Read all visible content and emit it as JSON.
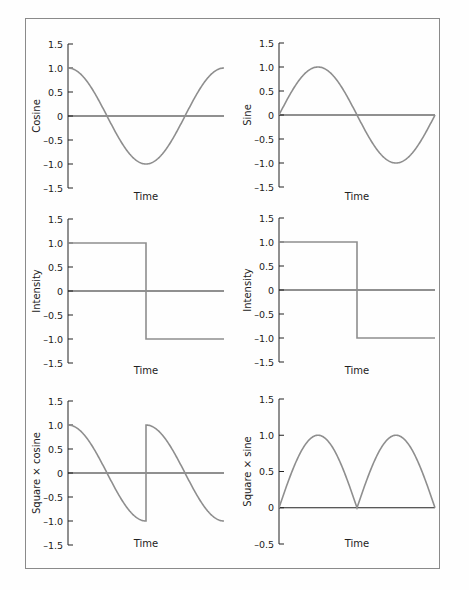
{
  "chart_data": [
    {
      "type": "line",
      "panel": "top-left",
      "ylabel": "Cosine",
      "xlabel": "Time",
      "ylim": [
        -1.5,
        1.5
      ],
      "yticks": [
        "1.5",
        "1.0",
        "0.5",
        "0",
        "–0.5",
        "–1.0",
        "–1.5"
      ],
      "series": [
        {
          "name": "cosine",
          "function": "cos(t)",
          "t_range": [
            0,
            6.2832
          ],
          "x": [
            0,
            0.25,
            0.5,
            0.75,
            1.0
          ],
          "values": [
            1.0,
            0.0,
            -1.0,
            0.0,
            1.0
          ]
        }
      ]
    },
    {
      "type": "line",
      "panel": "top-right",
      "ylabel": "Sine",
      "xlabel": "Time",
      "ylim": [
        -1.5,
        1.5
      ],
      "yticks": [
        "1.5",
        "1.0",
        "0.5",
        "0",
        "–0.5",
        "–1.0",
        "–1.5"
      ],
      "series": [
        {
          "name": "sine",
          "function": "sin(t)",
          "t_range": [
            0,
            6.2832
          ],
          "x": [
            0,
            0.25,
            0.5,
            0.75,
            1.0
          ],
          "values": [
            0.0,
            1.0,
            0.0,
            -1.0,
            0.0
          ]
        }
      ]
    },
    {
      "type": "line",
      "panel": "middle-left",
      "ylabel": "Intensity",
      "xlabel": "Time",
      "ylim": [
        -1.5,
        1.5
      ],
      "yticks": [
        "1.5",
        "1.0",
        "0.5",
        "0",
        "–0.5",
        "–1.0",
        "–1.5"
      ],
      "series": [
        {
          "name": "square wave",
          "x": [
            0,
            0.5,
            0.5,
            1.0
          ],
          "values": [
            1.0,
            1.0,
            -1.0,
            -1.0
          ]
        }
      ]
    },
    {
      "type": "line",
      "panel": "middle-right",
      "ylabel": "Intensity",
      "xlabel": "Time",
      "ylim": [
        -1.5,
        1.5
      ],
      "yticks": [
        "1.5",
        "1.0",
        "0.5",
        "0",
        "–0.5",
        "–1.0",
        "–1.5"
      ],
      "series": [
        {
          "name": "square wave",
          "x": [
            0,
            0.5,
            0.5,
            1.0
          ],
          "values": [
            1.0,
            1.0,
            -1.0,
            -1.0
          ]
        }
      ]
    },
    {
      "type": "line",
      "panel": "bottom-left",
      "ylabel": "Square × cosine",
      "xlabel": "Time",
      "ylim": [
        -1.5,
        1.5
      ],
      "yticks": [
        "1.5",
        "1.0",
        "0.5",
        "0",
        "–0.5",
        "–1.0",
        "–1.5"
      ],
      "series": [
        {
          "name": "square x cosine",
          "function": "sq(t)*cos(t)",
          "x": [
            0,
            0.25,
            0.5,
            0.5,
            0.75,
            1.0
          ],
          "values": [
            1.0,
            0.0,
            -1.0,
            1.0,
            0.0,
            -1.0
          ]
        }
      ]
    },
    {
      "type": "line",
      "panel": "bottom-right",
      "ylabel": "Square × sine",
      "xlabel": "Time",
      "ylim": [
        -0.5,
        1.5
      ],
      "yticks": [
        "1.5",
        "1.0",
        "0.5",
        "0",
        "–0.5"
      ],
      "series": [
        {
          "name": "square x sine",
          "function": "|sin(t)|",
          "x": [
            0,
            0.25,
            0.5,
            0.75,
            1.0
          ],
          "values": [
            0.0,
            1.0,
            0.0,
            1.0,
            0.0
          ]
        }
      ]
    }
  ]
}
